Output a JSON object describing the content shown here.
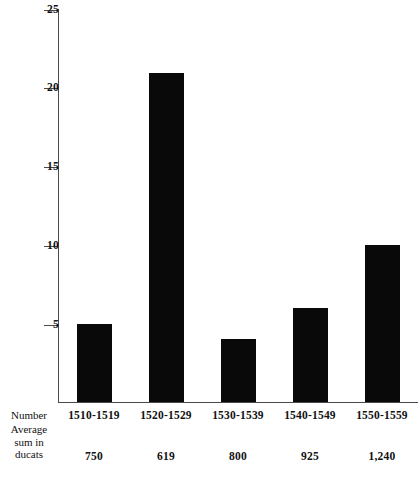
{
  "chart_data": {
    "type": "bar",
    "title": "",
    "subtitle": "",
    "xlabel": "",
    "ylabel": "",
    "categories": [
      "1510-1519",
      "1520-1529",
      "1530-1539",
      "1540-1549",
      "1550-1559"
    ],
    "values": [
      5,
      21,
      4,
      6,
      10
    ],
    "ylim": [
      0,
      25
    ],
    "yticks": [
      5,
      10,
      15,
      20,
      25
    ],
    "ytick_labels": [
      "5",
      "10",
      "15",
      "20",
      "25"
    ],
    "grid": false,
    "legend": null,
    "bar_color": "#090909",
    "axis_color": "#4a4a4a",
    "background_color": "#ffffff",
    "series": [
      {
        "name": "Number",
        "values": [
          5,
          21,
          4,
          6,
          10
        ]
      }
    ],
    "table_rows": [
      {
        "label": "Number",
        "label_lines": [
          "Number"
        ],
        "values": [
          "1510-1519",
          "1520-1529",
          "1530-1539",
          "1540-1549",
          "1550-1559"
        ]
      },
      {
        "label": "Average sum in ducats",
        "label_lines": [
          "Average",
          "sum in",
          "ducats"
        ],
        "values": [
          "750",
          "619",
          "800",
          "925",
          "1,240"
        ]
      }
    ]
  },
  "axis": {
    "ticks": [
      {
        "label": "25",
        "value": 25
      },
      {
        "label": "20",
        "value": 20
      },
      {
        "label": "15",
        "value": 15
      },
      {
        "label": "10",
        "value": 10
      },
      {
        "label": "5",
        "value": 5
      }
    ]
  },
  "table": {
    "row_labels": {
      "number": "Number",
      "average_line1": "Average",
      "average_line2": "sum in",
      "average_line3": "ducats"
    },
    "decades": [
      "1510-1519",
      "1520-1529",
      "1530-1539",
      "1540-1549",
      "1550-1559"
    ],
    "ducats": [
      "750",
      "619",
      "800",
      "925",
      "1,240"
    ]
  }
}
